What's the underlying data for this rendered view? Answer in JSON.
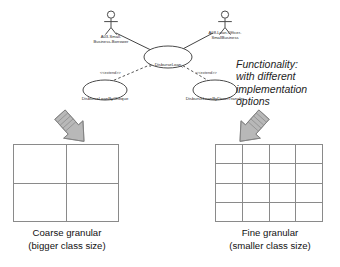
{
  "diagram": {
    "actors": [
      {
        "id": "actor-left",
        "label_line1": "A03-Small-",
        "label_line2": "Business-Borrower"
      },
      {
        "id": "actor-right",
        "label_line1": "A08-Loan-Officer-",
        "label_line2": "SmallBusiness"
      }
    ],
    "use_cases": {
      "main": {
        "label": "DisburseLoan"
      },
      "extensions": [
        {
          "id": "uc-cheque",
          "label": "DisburseLoanByCheque",
          "stereotype": "<<extend>>"
        },
        {
          "id": "uc-transfer",
          "label": "DisburseLoanByDirectTransfer",
          "stereotype": "<<extend>>"
        }
      ]
    },
    "note": {
      "line1": "Functionality:",
      "line2": "with different",
      "line3": "implementation",
      "line4": "options"
    },
    "panels": [
      {
        "id": "panel-coarse",
        "grid_rows": 2,
        "grid_cols": 2,
        "caption_line1": "Coarse granular",
        "caption_line2": "(bigger class size)"
      },
      {
        "id": "panel-fine",
        "grid_rows": 4,
        "grid_cols": 4,
        "caption_line1": "Fine granular",
        "caption_line2": "(smaller class size)"
      }
    ],
    "colors": {
      "stroke": "#8a8a8a",
      "arrow_fill": "#b3b3b3",
      "arrow_stroke": "#6e6e6e",
      "text": "#111111"
    }
  }
}
